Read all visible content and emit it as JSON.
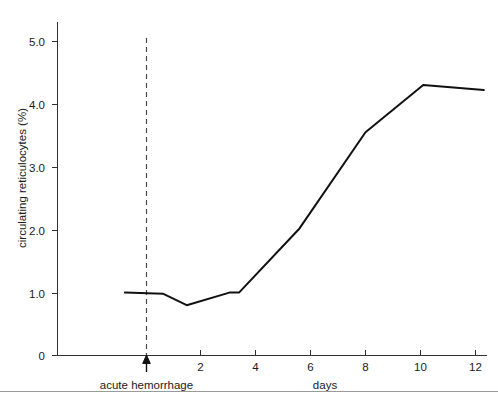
{
  "chart_data": {
    "type": "line",
    "title": "",
    "subtitle": "",
    "xlabel": "days",
    "ylabel": "circulating reticulocytes (%)",
    "xlim": [
      -0.8,
      12.8
    ],
    "ylim": [
      0,
      5.45
    ],
    "grid": false,
    "legend": null,
    "x_ticks": [
      2,
      4,
      6,
      8,
      10,
      12
    ],
    "x_tick_labels": [
      "2",
      "4",
      "6",
      "8",
      "10",
      "12"
    ],
    "y_ticks": [
      0,
      1.0,
      2.0,
      3.0,
      4.0,
      5.0
    ],
    "y_tick_labels": [
      "0",
      "1.0",
      "2.0",
      "3.0",
      "4.0",
      "5.0"
    ],
    "series": [
      {
        "name": "circulating reticulocytes",
        "color": "#111111",
        "x": [
          -0.75,
          0.65,
          1.5,
          3.05,
          3.4,
          5.6,
          8.0,
          10.1,
          12.3
        ],
        "y": [
          1.0,
          0.98,
          0.8,
          1.0,
          1.0,
          2.02,
          3.55,
          4.3,
          4.22
        ]
      }
    ],
    "annotations": [
      {
        "name": "acute-hemorrhage-marker",
        "label": "acute hemorrhage",
        "x": 1.5,
        "type": "vertical-dashed-line-with-arrow",
        "line_color": "#4a4a4a",
        "line_top_value": 5.1
      }
    ]
  },
  "axis": {
    "y_label": "circulating reticulocytes (%)",
    "x_label": "days",
    "y_tick_labels": [
      "5.0",
      "4.0",
      "3.0",
      "2.0",
      "1.0",
      "0"
    ],
    "x_tick_labels": [
      "2",
      "4",
      "6",
      "8",
      "10",
      "12"
    ]
  },
  "annotation": {
    "acute_hemorrhage": "acute hemorrhage"
  },
  "colors": {
    "line": "#111111",
    "axis": "#303030",
    "dashed_marker": "#4a4a4a",
    "background": "#ffffff",
    "footer_rule": "#9a9a9a"
  }
}
